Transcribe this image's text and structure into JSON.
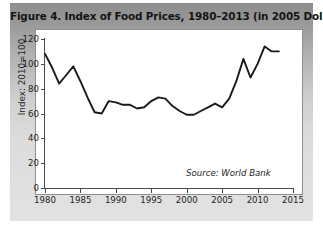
{
  "figure": {
    "title": "Figure 4. Index of Food Prices, 1980–2013 (in 2005 Dollars)",
    "source_note": "Source: World Bank"
  },
  "chart_data": {
    "type": "line",
    "title": "Figure 4. Index of Food Prices, 1980–2013 (in 2005 Dollars)",
    "xlabel": "",
    "ylabel": "Index: 2010=100",
    "xlim": [
      1980,
      2015
    ],
    "ylim": [
      0,
      120
    ],
    "xticks": [
      1980,
      1985,
      1990,
      1995,
      2000,
      2005,
      2010,
      2015
    ],
    "xtick_labels": [
      "1980",
      "1985",
      "1990",
      "1995",
      "2000",
      "2005",
      "2010",
      "2015"
    ],
    "yticks": [
      0,
      20,
      40,
      60,
      80,
      100,
      120
    ],
    "ytick_labels": [
      "0",
      "20",
      "40",
      "60",
      "80",
      "100",
      "120"
    ],
    "grid": false,
    "legend": null,
    "annotations": [
      {
        "text": "Source: World Bank",
        "x": 2006.5,
        "y": 16,
        "style": "italic"
      }
    ],
    "line_color": "#1a1a1a",
    "line_width": 1.9,
    "x": [
      1980,
      1981,
      1982,
      1983,
      1984,
      1985,
      1986,
      1987,
      1988,
      1989,
      1990,
      1991,
      1992,
      1993,
      1994,
      1995,
      1996,
      1997,
      1998,
      1999,
      2000,
      2001,
      2002,
      2003,
      2004,
      2005,
      2006,
      2007,
      2008,
      2009,
      2010,
      2011,
      2012,
      2013
    ],
    "values": [
      108,
      97,
      84,
      91,
      98,
      86,
      73,
      61,
      60,
      70,
      69,
      67,
      67,
      64,
      65,
      70,
      73,
      72,
      66,
      62,
      59,
      59,
      62,
      65,
      68,
      65,
      72,
      86,
      104,
      89,
      100,
      114,
      110,
      110
    ]
  }
}
